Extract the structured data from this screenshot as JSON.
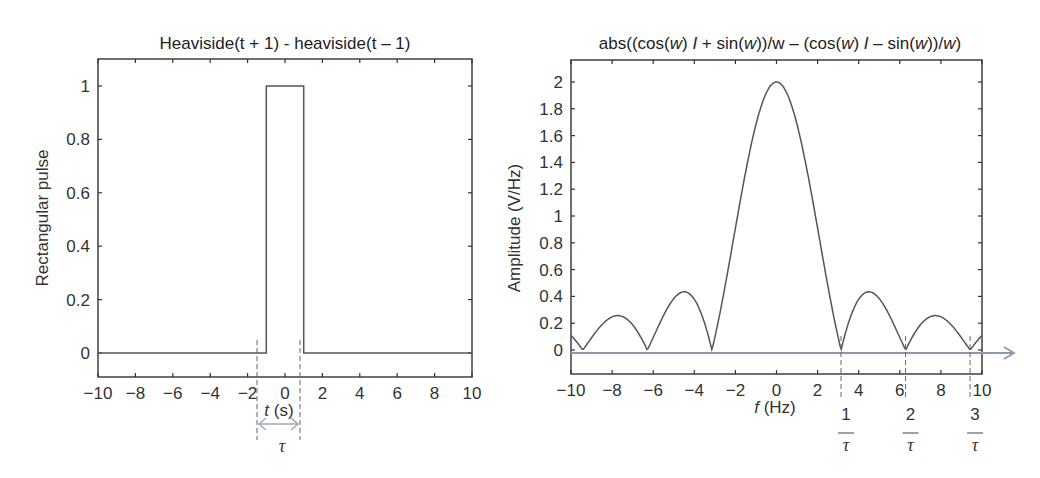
{
  "chart_data": [
    {
      "type": "line",
      "title": "Heaviside(t + 1) - heaviside(t – 1)",
      "xlabel": "t (s)",
      "ylabel": "Rectangular pulse",
      "xlim": [
        -10,
        10
      ],
      "ylim": [
        -0.1,
        1.1
      ],
      "xticks": [
        -10,
        -8,
        -6,
        -4,
        -2,
        0,
        2,
        4,
        6,
        8,
        10
      ],
      "xtick_labels": [
        "−10",
        "−8",
        "−6",
        "−4",
        "−2",
        "0",
        "2",
        "4",
        "6",
        "8",
        "10"
      ],
      "yticks": [
        0,
        0.2,
        0.4,
        0.6,
        0.8,
        1
      ],
      "ytick_labels": [
        "0",
        "0.2",
        "0.4",
        "0.6",
        "0.8",
        "1"
      ],
      "grid": false,
      "series": [
        {
          "name": "rect",
          "x": [
            -10,
            -1,
            -1,
            1,
            1,
            10
          ],
          "values": [
            0,
            0,
            1,
            1,
            0,
            0
          ]
        }
      ],
      "annotations": {
        "tau_label": "τ",
        "tau_span": [
          -1,
          1
        ],
        "description": "dashed lines at t=±1 with double arrow labeled τ"
      }
    },
    {
      "type": "line",
      "title": "abs((cos(w) I + sin(w))/w – (cos(w) I – sin(w))/w)",
      "xlabel": "f (Hz)",
      "ylabel": "Amplitude (V/Hz)",
      "xlim": [
        -10,
        10
      ],
      "ylim": [
        -0.17,
        2.15
      ],
      "xticks": [
        -10,
        -8,
        -6,
        -4,
        -2,
        0,
        2,
        4,
        6,
        8,
        10
      ],
      "xtick_labels": [
        "−10",
        "−8",
        "−6",
        "−4",
        "−2",
        "0",
        "2",
        "4",
        "6",
        "8",
        "10"
      ],
      "yticks": [
        0,
        0.2,
        0.4,
        0.6,
        0.8,
        1,
        1.2,
        1.4,
        1.6,
        1.8,
        2
      ],
      "ytick_labels": [
        "0",
        "0.2",
        "0.4",
        "0.6",
        "0.8",
        "1",
        "1.2",
        "1.4",
        "1.6",
        "1.8",
        "2"
      ],
      "grid": false,
      "series": [
        {
          "name": "|2 sin(w)/w|",
          "x": [
            -10,
            -9.42,
            -7.73,
            -6.28,
            -4.49,
            -3.14,
            -2,
            -1,
            0,
            1,
            2,
            3.14,
            4.49,
            6.28,
            7.73,
            9.42,
            10
          ],
          "values": [
            0.11,
            0,
            0.26,
            0,
            0.43,
            0,
            0.91,
            1.68,
            2,
            1.68,
            0.91,
            0,
            0.43,
            0,
            0.26,
            0,
            0.11
          ]
        }
      ],
      "annotations": {
        "zero_markers": [
          {
            "x": 3.14,
            "num": "1",
            "den": "τ"
          },
          {
            "x": 6.28,
            "num": "2",
            "den": "τ"
          },
          {
            "x": 9.42,
            "num": "3",
            "den": "τ"
          }
        ],
        "arrow_axis": "horizontal arrow at y=0 extending beyond right axis"
      }
    }
  ]
}
